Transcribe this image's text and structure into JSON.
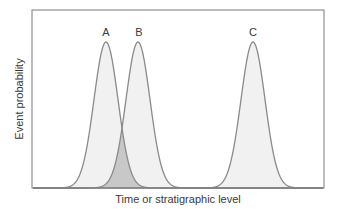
{
  "chart_data": {
    "type": "area",
    "title": "",
    "xlabel": "Time or stratigraphic level",
    "ylabel": "Event probability",
    "grid": false,
    "legend": "none",
    "series": [
      {
        "name": "A",
        "mean": 106,
        "sigma": 12,
        "peak": 1.0,
        "fill": "#f1f1f1",
        "stroke": "#8a8a8a"
      },
      {
        "name": "B",
        "mean": 138,
        "sigma": 12,
        "peak": 1.0,
        "fill": "#f1f1f1",
        "stroke": "#8a8a8a"
      },
      {
        "name": "C",
        "mean": 253,
        "sigma": 12,
        "peak": 1.0,
        "fill": "#f1f1f1",
        "stroke": "#8a8a8a"
      }
    ],
    "overlap_region": {
      "between": [
        "A",
        "B"
      ],
      "fill": "#c8c8c8"
    },
    "annotations": [
      "A",
      "B",
      "C"
    ]
  },
  "labels": {
    "x_axis": "Time or stratigraphic level",
    "y_axis": "Event probability",
    "curve_a": "A",
    "curve_b": "B",
    "curve_c": "C"
  },
  "colors": {
    "frame": "#7a7a7a",
    "curve_stroke": "#8a8a8a",
    "curve_fill": "#f1f1f1",
    "overlap_fill": "#c8c8c8",
    "text": "#3a3a3a"
  }
}
